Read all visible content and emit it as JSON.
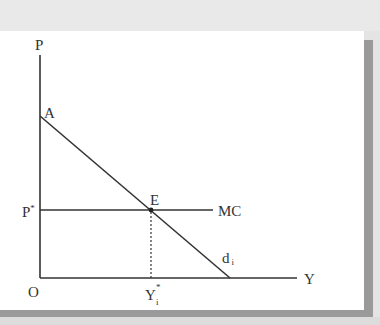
{
  "figure": {
    "type": "economics-diagram",
    "axes": {
      "y_label": "P",
      "x_label": "Y",
      "origin_label": "O"
    },
    "curves": [
      {
        "id": "demand",
        "label": "d",
        "label_subscript": "i",
        "kind": "downward-sloping line",
        "from_point": "A"
      },
      {
        "id": "marginal-cost",
        "label": "MC",
        "kind": "horizontal line",
        "level": "P*"
      }
    ],
    "points": [
      {
        "id": "A",
        "label": "A",
        "description": "demand curve intercept on price axis"
      },
      {
        "id": "E",
        "label": "E",
        "description": "intersection of demand and MC"
      }
    ],
    "ticks": {
      "price_level": {
        "label": "P",
        "superscript": "*"
      },
      "quantity_level": {
        "label": "Y",
        "superscript": "*",
        "subscript": "i"
      }
    },
    "dashed_guide": "from E down to Y*i"
  },
  "colors": {
    "line": "#333333",
    "background": "#ffffff",
    "frame_shadow": "#9a9a9a",
    "page_band": "#e9e9e9"
  }
}
